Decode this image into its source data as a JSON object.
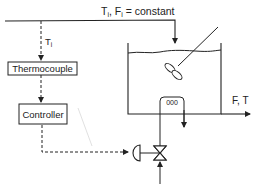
{
  "diagram": {
    "type": "process-control-schematic",
    "inlet_label": "Tᵢ, Fᵢ = constant",
    "inlet_label_parts": {
      "t": "T",
      "t_sub": "i",
      "f": "F",
      "f_sub": "i",
      "suffix": "= constant"
    },
    "measurement_label": {
      "main": "T",
      "sub": "i"
    },
    "blocks": {
      "thermocouple": "Thermocouple",
      "controller": "Controller"
    },
    "outlet_label": "F, T",
    "coil_glyph": "000",
    "colors": {
      "line": "#222222",
      "background": "#ffffff"
    }
  }
}
